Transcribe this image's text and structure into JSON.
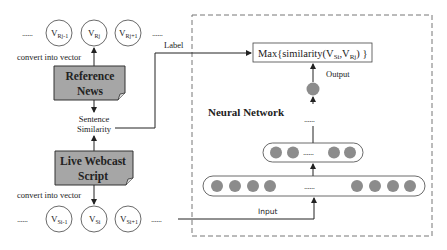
{
  "diagram": {
    "top_vectors": {
      "leading_dots": "......",
      "trailing_dots": "......",
      "items": [
        {
          "main": "V",
          "sub": "Rj-1"
        },
        {
          "main": "V",
          "sub": "Rj"
        },
        {
          "main": "V",
          "sub": "Rj+1"
        }
      ],
      "caption": "convert into vector"
    },
    "reference_box": {
      "line1": "Reference",
      "line2": "News"
    },
    "similarity": {
      "line1": "Sentence",
      "line2": "Similarity"
    },
    "live_box": {
      "line1": "Live Webcast",
      "line2": "Script"
    },
    "bottom_vectors": {
      "leading_dots": "......",
      "trailing_dots": "......",
      "items": [
        {
          "main": "V",
          "sub": "Si-1"
        },
        {
          "main": "V",
          "sub": "Si"
        },
        {
          "main": "V",
          "sub": "Si+1"
        }
      ],
      "caption": "convert into vector"
    },
    "label_text": "Label",
    "neural_network": {
      "title": "Neural Network",
      "max_box": {
        "prefix": "Max{similarity(V",
        "sub1": "Si",
        "mid": ",V",
        "sub2": "Rj",
        "suffix": ") }"
      },
      "output_label": "Output",
      "input_label": "Input",
      "hidden_dots": "......",
      "middle_layer_dots": "......",
      "input_layer_dots": "......"
    },
    "colors": {
      "box_fill": "#a6a6a6",
      "node_fill": "#8c8c8c",
      "line": "#222222",
      "dashed_border": "#777777"
    }
  }
}
